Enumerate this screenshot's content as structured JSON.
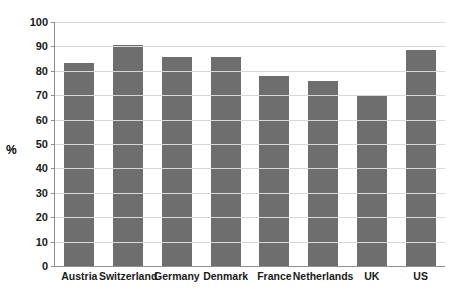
{
  "chart_data": {
    "type": "bar",
    "title": "",
    "subtitle": "",
    "xlabel": "",
    "ylabel": "%",
    "categories": [
      "Austria",
      "Switzerland",
      "Germany",
      "Denmark",
      "France",
      "Netherlands",
      "UK",
      "US"
    ],
    "values": [
      83,
      90.5,
      85.5,
      85.5,
      78,
      76,
      69.5,
      88.5
    ],
    "series": [
      {
        "name": "",
        "values": [
          83,
          90.5,
          85.5,
          85.5,
          78,
          76,
          69.5,
          88.5
        ]
      }
    ],
    "ylim": [
      0,
      100
    ],
    "ytick_labels": [
      "0",
      "10",
      "20",
      "30",
      "40",
      "50",
      "60",
      "70",
      "80",
      "90",
      "100"
    ],
    "ytick_values": [
      0,
      10,
      20,
      30,
      40,
      50,
      60,
      70,
      80,
      90,
      100
    ],
    "grid": true,
    "grid_axis": "y",
    "legend": "none",
    "bar_color": "#6e6e6e",
    "grid_color": "#d8d8d8",
    "axis_color": "#8e8e8e",
    "text_color": "#1a1a1a",
    "background": "#ffffff"
  }
}
